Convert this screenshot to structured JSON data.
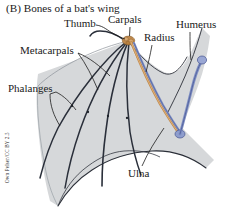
{
  "figure": {
    "panel_letter": "(B)",
    "title": "(B)  Bones of a bat's wing",
    "credit": "Own Pelser/CC BY 2.5",
    "background_color": "#ffffff"
  },
  "labels": {
    "thumb": "Thumb",
    "carpals": "Carpals",
    "humerus": "Humerus",
    "radius": "Radius",
    "metacarpals": "Metacarpals",
    "phalanges": "Phalanges",
    "ulna": "Ulna"
  },
  "colors": {
    "membrane": "#d6d8da",
    "membrane_edge": "#2b2f38",
    "bone_digit": "#2a2f3a",
    "bone_orange": "#c08a4e",
    "bone_blue": "#7f8fc4",
    "leader_line": "#222222",
    "text": "#1a1a1a"
  },
  "anatomy": {
    "parts": [
      {
        "name": "Humerus",
        "color": "#7f8fc4",
        "region": "upper-arm"
      },
      {
        "name": "Radius",
        "color": "#c08a4e",
        "region": "forearm"
      },
      {
        "name": "Ulna",
        "color": "#7f8fc4",
        "region": "forearm"
      },
      {
        "name": "Carpals",
        "color": "#c08a4e",
        "region": "wrist"
      },
      {
        "name": "Metacarpals",
        "color": "#2a2f3a",
        "region": "hand"
      },
      {
        "name": "Phalanges",
        "color": "#2a2f3a",
        "region": "digits"
      },
      {
        "name": "Thumb",
        "color": "#2a2f3a",
        "region": "digit-1"
      }
    ],
    "digit_count": 5
  }
}
